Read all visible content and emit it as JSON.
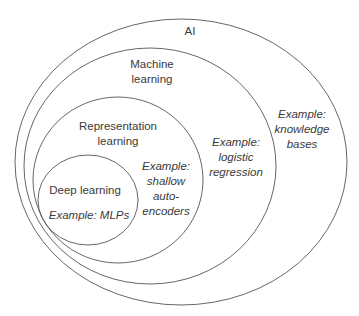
{
  "diagram": {
    "type": "nested-euler",
    "stroke_color": "#555555",
    "text_color": "#3a3a3a",
    "sets": [
      {
        "id": "ai",
        "label": "AI",
        "example": "Example:\nknowledge\nbases",
        "example_lines": [
          "Example:",
          "knowledge",
          "bases"
        ],
        "ellipse": {
          "cx": 181,
          "cy": 162,
          "rx": 166,
          "ry": 143
        }
      },
      {
        "id": "ml",
        "label_lines": [
          "Machine",
          "learning"
        ],
        "example_lines": [
          "Example:",
          "logistic",
          "regression"
        ],
        "ellipse": {
          "cx": 150,
          "cy": 166,
          "rx": 126,
          "ry": 118
        }
      },
      {
        "id": "rl",
        "label_lines": [
          "Representation",
          "learning"
        ],
        "example_lines": [
          "Example:",
          "shallow",
          "auto-",
          "encoders"
        ],
        "ellipse": {
          "cx": 118,
          "cy": 180,
          "rx": 85,
          "ry": 83
        }
      },
      {
        "id": "dl",
        "label_lines": [
          "Deep learning"
        ],
        "example_lines": [
          "Example: MLPs"
        ],
        "ellipse": {
          "cx": 88,
          "cy": 200,
          "rx": 50,
          "ry": 45
        }
      }
    ]
  },
  "labels": {
    "ai": "AI",
    "ml_1": "Machine",
    "ml_2": "learning",
    "rl_1": "Representation",
    "rl_2": "learning",
    "dl": "Deep learning",
    "ex_ai_1": "Example:",
    "ex_ai_2": "knowledge",
    "ex_ai_3": "bases",
    "ex_ml_1": "Example:",
    "ex_ml_2": "logistic",
    "ex_ml_3": "regression",
    "ex_rl_1": "Example:",
    "ex_rl_2": "shallow",
    "ex_rl_3": "auto-",
    "ex_rl_4": "encoders",
    "ex_dl": "Example: MLPs"
  }
}
